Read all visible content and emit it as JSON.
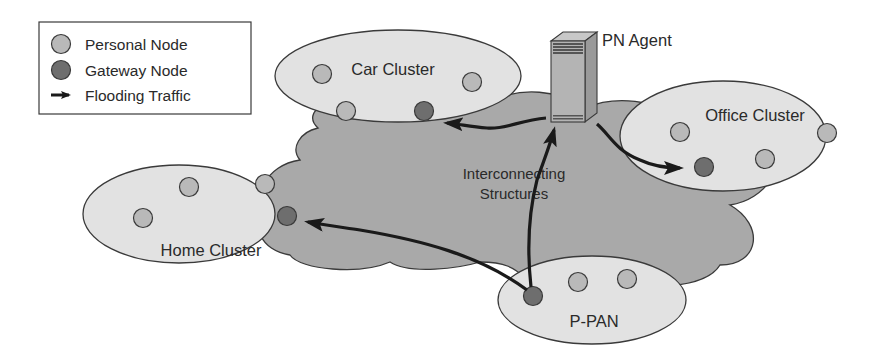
{
  "colors": {
    "background": "#ffffff",
    "cloud_fill": "#a9a9a9",
    "cluster_fill": "#e2e2e2",
    "personal_node": "#b9b9b9",
    "gateway_node": "#6e6e6e",
    "stroke": "#3a3a3a",
    "arrow": "#1a1a1a"
  },
  "legend": {
    "items": [
      {
        "icon": "personal-node-icon",
        "label": "Personal Node"
      },
      {
        "icon": "gateway-node-icon",
        "label": "Gateway Node"
      },
      {
        "icon": "arrow-icon",
        "label": "Flooding Traffic"
      }
    ]
  },
  "cloud": {
    "label_line1": "Interconnecting",
    "label_line2": "Structures"
  },
  "pn_agent": {
    "label": "PN Agent",
    "icon": "server-icon"
  },
  "clusters": [
    {
      "id": "car",
      "label": "Car Cluster",
      "personal_nodes": 3,
      "gateway_nodes": 1
    },
    {
      "id": "office",
      "label": "Office Cluster",
      "personal_nodes": 3,
      "gateway_nodes": 1
    },
    {
      "id": "home",
      "label": "Home Cluster",
      "personal_nodes": 3,
      "gateway_nodes": 1
    },
    {
      "id": "ppan",
      "label": "P-PAN",
      "personal_nodes": 2,
      "gateway_nodes": 1
    }
  ],
  "flows": [
    {
      "from": "PN Agent",
      "to": "Car Cluster gateway"
    },
    {
      "from": "PN Agent",
      "to": "Office Cluster gateway"
    },
    {
      "from": "P-PAN gateway",
      "to": "Home Cluster gateway"
    },
    {
      "from": "P-PAN gateway",
      "to": "PN Agent"
    }
  ]
}
